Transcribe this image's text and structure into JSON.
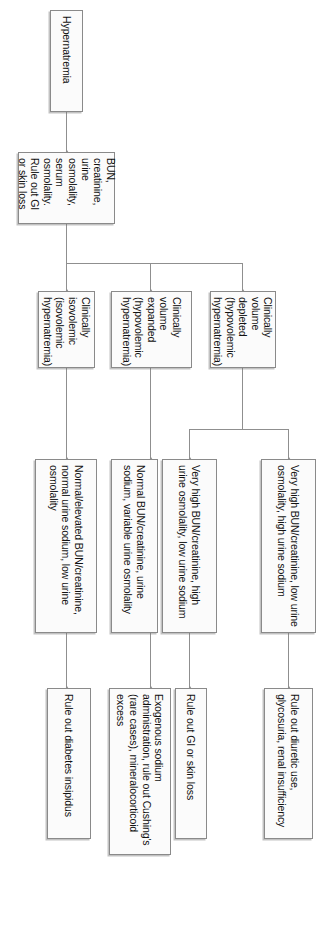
{
  "diagram": {
    "orientation": "left-to-right (rendered rotated 90 degrees)",
    "nodes": {
      "start": {
        "id": "start",
        "label": "Hypernatremia"
      },
      "workup": {
        "id": "workup",
        "label": "BUN, creatinine, urine osmolality, serum osmolality. Rule out GI or skin loss"
      },
      "volume_depleted": {
        "id": "volume_depleted",
        "label": "Clinically volume depleted (hypovolemic hypernatremia)"
      },
      "volume_expanded": {
        "id": "volume_expanded",
        "label": "Clinically volume expanded (hypovolemic hypernatremia)"
      },
      "isovolemic": {
        "id": "isovolemic",
        "label": "Clinically isovolemic (isovolemic hypernatremia)"
      },
      "labs_renal": {
        "id": "labs_renal",
        "label": "Very high BUN/creatinine, low urine osmolality, high urine sodium"
      },
      "labs_extrarenal": {
        "id": "labs_extrarenal",
        "label": "Very high BUN/creatinine, high urine osmolality, low urine sodium"
      },
      "labs_normal": {
        "id": "labs_normal",
        "label": "Normal BUN/creatinine, urine sodium, variable urine osmolality"
      },
      "labs_di": {
        "id": "labs_di",
        "label": "Normal/elevated BUN/creatinine, normal urine sodium, low urine osmolality"
      },
      "dx_diuretic": {
        "id": "dx_diuretic",
        "label": "Rule out diuretic use, glycosuria, renal insufficiency"
      },
      "dx_gi_skin": {
        "id": "dx_gi_skin",
        "label": "Rule out GI or skin loss"
      },
      "dx_exogenous": {
        "id": "dx_exogenous",
        "label": "Exogenous sodium administration, rule out Cushing's (rare cases), mineralocorticoid excess"
      },
      "dx_di": {
        "id": "dx_di",
        "label": "Rule out diabetes insipidus"
      }
    },
    "edges": [
      {
        "from": "start",
        "to": "workup"
      },
      {
        "from": "workup",
        "to": "volume_depleted"
      },
      {
        "from": "workup",
        "to": "volume_expanded"
      },
      {
        "from": "workup",
        "to": "isovolemic"
      },
      {
        "from": "volume_depleted",
        "to": "labs_renal"
      },
      {
        "from": "volume_depleted",
        "to": "labs_extrarenal"
      },
      {
        "from": "volume_expanded",
        "to": "labs_normal"
      },
      {
        "from": "isovolemic",
        "to": "labs_di"
      },
      {
        "from": "labs_renal",
        "to": "dx_diuretic"
      },
      {
        "from": "labs_extrarenal",
        "to": "dx_gi_skin"
      },
      {
        "from": "labs_normal",
        "to": "dx_exogenous"
      },
      {
        "from": "labs_di",
        "to": "dx_di"
      }
    ],
    "colors": {
      "node_border": "#8a8a8a",
      "node_fill": "#fbfbfb",
      "edge": "#8f8f8f",
      "text": "#111111",
      "background": "#ffffff"
    }
  }
}
